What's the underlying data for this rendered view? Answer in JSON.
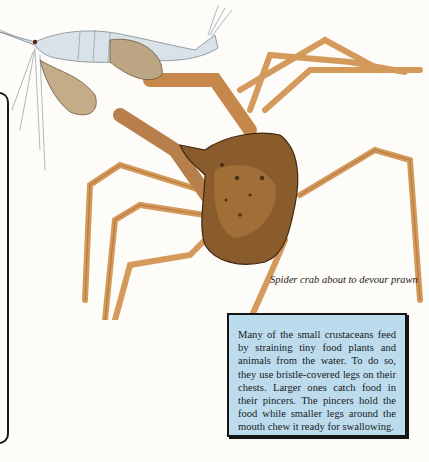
{
  "illustration": {
    "subject": "Spider crab about to devour prawn",
    "colors": {
      "prawn_body": "#d6e0e6",
      "crab_shell": "#8a5a2a",
      "crab_shell_dark": "#4e3216",
      "crab_legs": "#d9a062",
      "claw": "#b98a58"
    }
  },
  "caption": "Spider crab about to devour prawn",
  "infobox": {
    "text": "Many of the small crustaceans feed by straining tiny food plants and animals from the water. To do so, they use bristle-covered legs on their chests. Larger ones catch food in their pincers. The pincers hold the food while smaller legs around the mouth chew it ready for swallowing.",
    "background": "#bcdcee",
    "border": "#151515"
  }
}
